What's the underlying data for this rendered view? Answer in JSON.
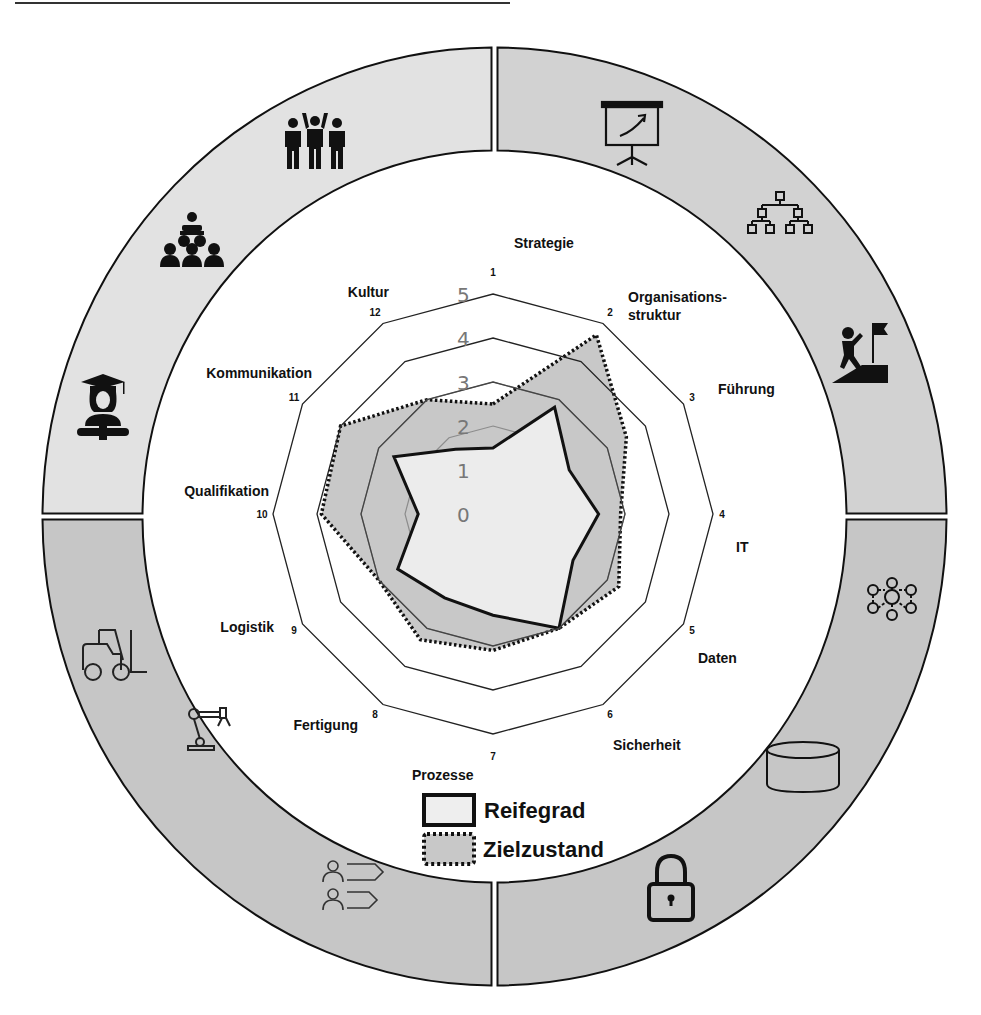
{
  "colors": {
    "quadrant_top_left": "#e2e2e2",
    "quadrant_top_right": "#d2d2d2",
    "quadrant_bottom_left": "#c6c6c6",
    "quadrant_bottom_right": "#c6c6c6",
    "reifegrad_fill": "#ececec",
    "zielzustand_fill": "#c8c8c8",
    "grid_outer": "#222222",
    "grid_inner": "#8c8c8c"
  },
  "chart_data": {
    "type": "radar",
    "title": "",
    "axes": [
      {
        "num": "1",
        "label": "Strategie"
      },
      {
        "num": "2",
        "label": "Organisations-\nstruktur"
      },
      {
        "num": "3",
        "label": "Führung"
      },
      {
        "num": "4",
        "label": "IT"
      },
      {
        "num": "5",
        "label": "Daten"
      },
      {
        "num": "6",
        "label": "Sicherheit"
      },
      {
        "num": "7",
        "label": "Prozesse"
      },
      {
        "num": "8",
        "label": "Fertigung"
      },
      {
        "num": "9",
        "label": "Logistik"
      },
      {
        "num": "10",
        "label": "Qualifikation"
      },
      {
        "num": "11",
        "label": "Kommunikation"
      },
      {
        "num": "12",
        "label": "Kultur"
      }
    ],
    "scale": {
      "min": 0,
      "max": 5,
      "ticks": [
        "0",
        "1",
        "2",
        "3",
        "4",
        "5"
      ]
    },
    "series": [
      {
        "name": "Zielzustand",
        "style": "dotted",
        "values": [
          2.5,
          4.7,
          3.5,
          2.9,
          3.3,
          3.0,
          3.1,
          3.3,
          3.0,
          3.9,
          4.0,
          3.0
        ]
      },
      {
        "name": "Reifegrad",
        "style": "solid",
        "values": [
          1.5,
          2.8,
          2.0,
          2.4,
          2.1,
          3.0,
          2.3,
          2.2,
          2.5,
          1.7,
          2.6,
          1.7
        ]
      }
    ],
    "legend": [
      "Reifegrad",
      "Zielzustand"
    ],
    "legend_position": "bottom-center",
    "grid": true
  },
  "legend": {
    "reifegrad_label": "Reifegrad",
    "zielzustand_label": "Zielzustand"
  },
  "ring": {
    "quadrants": [
      {
        "name": "top-left",
        "icons": [
          "celebrating-team-icon",
          "audience-presenter-icon",
          "graduate-icon"
        ]
      },
      {
        "name": "top-right",
        "icons": [
          "presentation-board-icon",
          "org-chart-icon",
          "climber-flag-icon"
        ]
      },
      {
        "name": "bottom-right",
        "icons": [
          "network-hub-icon",
          "database-cylinder-icon",
          "padlock-icon"
        ]
      },
      {
        "name": "bottom-left",
        "icons": [
          "forklift-icon",
          "robot-arm-icon",
          "process-flow-icon"
        ]
      }
    ]
  }
}
